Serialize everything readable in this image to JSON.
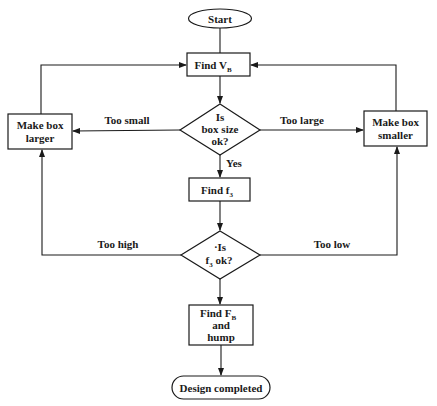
{
  "diagram": {
    "type": "flowchart",
    "nodes": {
      "start": {
        "label": "Start",
        "shape": "oval"
      },
      "find_vb": {
        "label": "Find V",
        "sub": "B",
        "shape": "rect"
      },
      "box_ok": {
        "line1": "Is",
        "line2": "box size",
        "line3": "ok?",
        "shape": "diamond"
      },
      "make_larger": {
        "line1": "Make box",
        "line2": "larger",
        "shape": "rect"
      },
      "make_smaller": {
        "line1": "Make box",
        "line2": "smaller",
        "shape": "rect"
      },
      "find_f3": {
        "label": "Find f",
        "sub": "3",
        "shape": "rect"
      },
      "f3_ok": {
        "line1": "·Is",
        "line2": "f",
        "line2_sub": "3",
        "line2_rest": " ok?",
        "shape": "diamond"
      },
      "find_fb": {
        "line1": "Find F",
        "line1_sub": "B",
        "line2": "and",
        "line3": "hump",
        "shape": "rect"
      },
      "done": {
        "label": "Design completed",
        "shape": "oval"
      }
    },
    "edge_labels": {
      "too_small": "Too small",
      "too_large": "Too large",
      "yes": "Yes",
      "too_high": "Too high",
      "too_low": "Too low"
    },
    "edges": [
      {
        "from": "start",
        "to": "find_vb"
      },
      {
        "from": "find_vb",
        "to": "box_ok"
      },
      {
        "from": "box_ok",
        "to": "make_larger",
        "label": "Too small"
      },
      {
        "from": "box_ok",
        "to": "make_smaller",
        "label": "Too large"
      },
      {
        "from": "box_ok",
        "to": "find_f3",
        "label": "Yes"
      },
      {
        "from": "make_larger",
        "to": "find_vb"
      },
      {
        "from": "make_smaller",
        "to": "find_vb"
      },
      {
        "from": "find_f3",
        "to": "f3_ok"
      },
      {
        "from": "f3_ok",
        "to": "make_larger",
        "label": "Too high"
      },
      {
        "from": "f3_ok",
        "to": "make_smaller",
        "label": "Too low"
      },
      {
        "from": "f3_ok",
        "to": "find_fb"
      },
      {
        "from": "find_fb",
        "to": "done"
      }
    ]
  }
}
